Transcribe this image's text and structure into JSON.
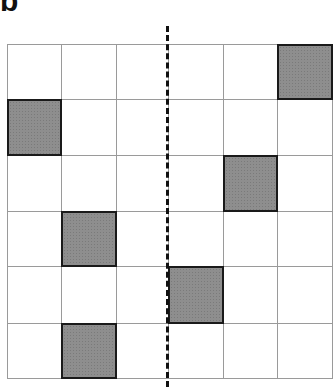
{
  "panel": {
    "label": "b"
  },
  "grid": {
    "rows": 6,
    "cols": 6,
    "cell_size": 55,
    "shaded_cells": [
      {
        "row": 0,
        "col": 5
      },
      {
        "row": 1,
        "col": 0
      },
      {
        "row": 2,
        "col": 4
      },
      {
        "row": 3,
        "col": 1
      },
      {
        "row": 4,
        "col": 3
      },
      {
        "row": 5,
        "col": 1
      }
    ],
    "shaded_color": "#8e8e8e",
    "line_color": "#9a9a9a"
  },
  "divider": {
    "style": "dashed",
    "position_after_col": 2,
    "color": "#111111"
  }
}
